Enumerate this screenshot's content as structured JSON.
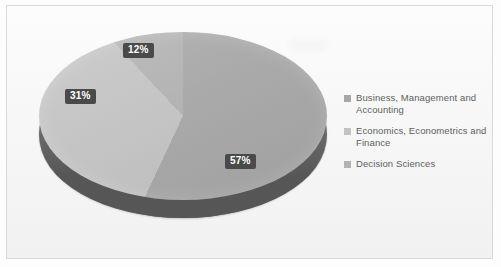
{
  "chart_data": {
    "type": "pie",
    "title": "",
    "categories": [
      "Business, Management and Accounting",
      "Economics, Econometrics and Finance",
      "Decision Sciences"
    ],
    "values": [
      57,
      31,
      12
    ],
    "value_labels": [
      "57%",
      "31%",
      "12%"
    ],
    "unit": "%",
    "legend_position": "right",
    "grid": false,
    "three_d": true,
    "slice_colors": [
      "#a8a8a8",
      "#c3c3c3",
      "#b2b2b2"
    ],
    "depth_color": "#6f6f6f",
    "label_text_color": "#ffffff",
    "label_background_color": "#4a4a4a",
    "border_color": "#d9d9d9",
    "background_color": "#f6f6f6"
  },
  "legend": {
    "items": [
      {
        "label": "Business, Management and Accounting",
        "swatch_color": "#a8a8a8"
      },
      {
        "label": "Economics, Econometrics and Finance",
        "swatch_color": "#c3c3c3"
      },
      {
        "label": "Decision Sciences",
        "swatch_color": "#b2b2b2"
      }
    ]
  }
}
